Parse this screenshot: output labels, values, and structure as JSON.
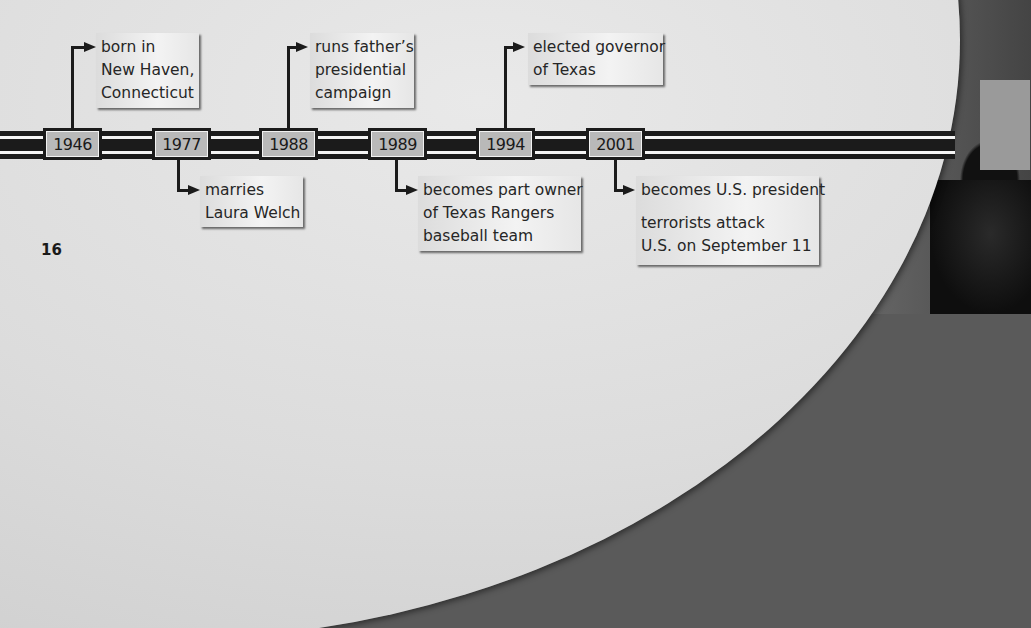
{
  "page_number": "16",
  "timeline": {
    "events": [
      {
        "year": "1946",
        "position": "above",
        "lines": [
          "born in",
          "New Haven,",
          "Connecticut"
        ]
      },
      {
        "year": "1977",
        "position": "below",
        "lines": [
          "marries",
          "Laura Welch"
        ]
      },
      {
        "year": "1988",
        "position": "above",
        "lines": [
          "runs father’s",
          "presidential",
          "campaign"
        ]
      },
      {
        "year": "1989",
        "position": "below",
        "lines": [
          "becomes part owner",
          "of Texas Rangers",
          "baseball team"
        ]
      },
      {
        "year": "1994",
        "position": "above",
        "lines": [
          "elected governor",
          "of Texas"
        ]
      },
      {
        "year": "2001",
        "position": "below",
        "lines": [
          "becomes U.S. president"
        ],
        "lines2": [
          "terrorists attack",
          "U.S. on September 11"
        ]
      }
    ]
  },
  "colors": {
    "page_bg": "#dcdcdc",
    "bar": "#1b1b1b",
    "year_box": "#b9b9b9",
    "caption_bg": "#efefef"
  }
}
